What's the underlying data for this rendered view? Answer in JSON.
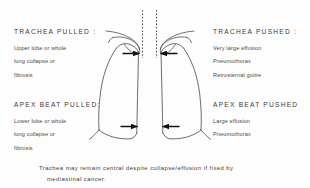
{
  "figure": {
    "type": "medical-diagram",
    "background_color": "#fdfdfd",
    "line_color": "#3a3a3a"
  },
  "quadrants": {
    "top_left": {
      "heading": "TRACHEA PULLED :",
      "items": [
        "Upper lobe or whole",
        "lung collapse or",
        "fibrosis"
      ]
    },
    "top_right": {
      "heading": "TRACHEA PUSHED :",
      "items": [
        "Very large effusion",
        "Pneumothorax",
        "Retrosternal goitre"
      ]
    },
    "bottom_left": {
      "heading": "APEX BEAT PULLED:",
      "items": [
        "Lower lobe or whole",
        "lung collapse or",
        "fibrosis"
      ]
    },
    "bottom_right": {
      "heading": "APEX BEAT PUSHED",
      "items": [
        "Large effusion",
        "Pneumothorax"
      ]
    }
  },
  "caption": {
    "line1": "Trachea may remain central despite collapse/effusion if fixed by",
    "line2": "mediastinal cancer."
  },
  "anatomy": {
    "trachea_label": "trachea",
    "left_lung_label": "left-lung",
    "right_lung_label": "right-lung",
    "diaphragm_label": "diaphragm",
    "arrows": [
      {
        "name": "trachea-arrow-left",
        "direction": "right"
      },
      {
        "name": "trachea-arrow-right",
        "direction": "left"
      },
      {
        "name": "apex-arrow-left",
        "direction": "right"
      },
      {
        "name": "apex-arrow-right",
        "direction": "left"
      }
    ]
  }
}
